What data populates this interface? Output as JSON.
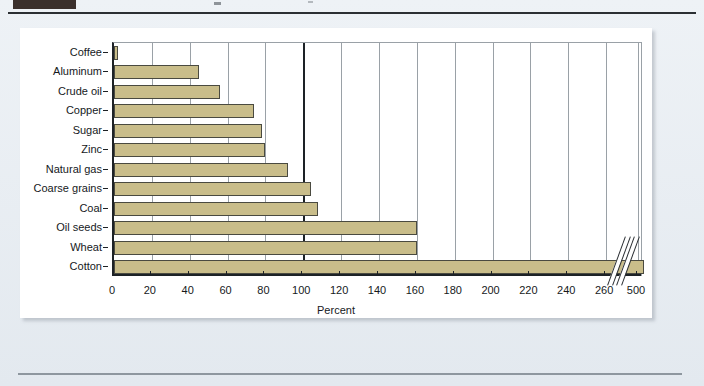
{
  "page": {
    "has_top_rule": true,
    "has_bottom_rule": true
  },
  "chart_data": {
    "type": "bar",
    "orientation": "horizontal",
    "title": "",
    "xlabel": "Percent",
    "ylabel": "",
    "categories": [
      "Coffee",
      "Aluminum",
      "Crude oil",
      "Copper",
      "Sugar",
      "Zinc",
      "Natural gas",
      "Coarse grains",
      "Coal",
      "Oil seeds",
      "Wheat",
      "Cotton"
    ],
    "values": [
      2,
      45,
      56,
      74,
      78,
      80,
      92,
      104,
      108,
      160,
      160,
      500
    ],
    "xlim": [
      0,
      280
    ],
    "xticks": [
      0,
      20,
      40,
      60,
      80,
      100,
      120,
      140,
      160,
      180,
      200,
      220,
      240,
      260,
      500
    ],
    "xtick_labels": [
      "0",
      "20",
      "40",
      "60",
      "80",
      "100",
      "120",
      "140",
      "160",
      "180",
      "200",
      "220",
      "240",
      "260",
      "500"
    ],
    "axis_break": {
      "present": true,
      "after_value": 260,
      "resumes_at": 500
    },
    "grid": "vertical",
    "emphasized_gridline": 100,
    "legend": "none",
    "bar_color": "#c9bd8a",
    "bar_edge_color": "#4a4a40",
    "plot_background": "#ffffff",
    "axis_color": "#1d2226"
  }
}
